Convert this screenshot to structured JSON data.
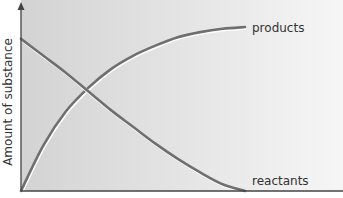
{
  "chart_data": {
    "type": "line",
    "title": "",
    "xlabel": "",
    "ylabel": "Amount of substance",
    "xlim": [
      0,
      1
    ],
    "ylim": [
      0,
      1
    ],
    "grid": false,
    "legend": "inline-right",
    "series": [
      {
        "name": "products",
        "color": "#6f6f6f",
        "x": [
          0,
          0.1,
          0.2,
          0.3,
          0.4,
          0.5,
          0.6,
          0.7,
          0.8,
          0.9,
          1.0
        ],
        "y": [
          0.0,
          0.27,
          0.47,
          0.61,
          0.72,
          0.8,
          0.86,
          0.91,
          0.94,
          0.96,
          0.97
        ]
      },
      {
        "name": "reactants",
        "color": "#6f6f6f",
        "x": [
          0,
          0.1,
          0.2,
          0.3,
          0.4,
          0.5,
          0.6,
          0.7,
          0.8,
          0.9,
          1.0
        ],
        "y": [
          0.9,
          0.8,
          0.7,
          0.59,
          0.48,
          0.38,
          0.28,
          0.19,
          0.11,
          0.04,
          0.0
        ]
      }
    ],
    "annotations": [
      {
        "text": "products",
        "series": "products"
      },
      {
        "text": "reactants",
        "series": "reactants"
      }
    ]
  }
}
